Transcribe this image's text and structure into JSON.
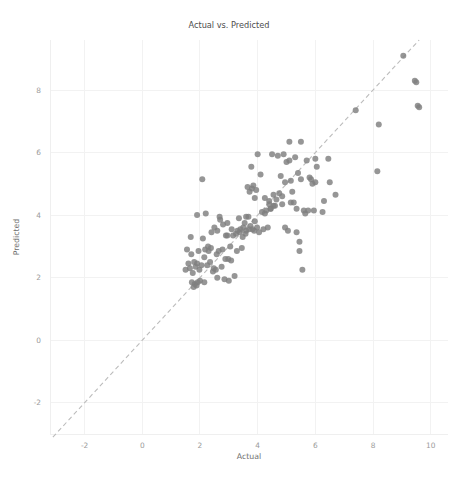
{
  "figure": {
    "width": 458,
    "height": 478,
    "background": "#ffffff"
  },
  "chart_data": {
    "type": "scatter",
    "title": "Actual vs. Predicted",
    "xlabel": "Actual",
    "ylabel": "Predicted",
    "xlim": [
      -3.2,
      10.6
    ],
    "ylim": [
      -3.0,
      9.6
    ],
    "xticks": [
      -2,
      0,
      2,
      4,
      6,
      8,
      10
    ],
    "xticklabels": [
      "-2",
      "0",
      "2",
      "4",
      "6",
      "8",
      "10"
    ],
    "yticks": [
      -2,
      0,
      2,
      4,
      6,
      8
    ],
    "yticklabels": [
      "-2",
      "0",
      "2",
      "4",
      "6",
      "8"
    ],
    "grid": true,
    "legend": null,
    "marker_color": "#7f7f7f",
    "marker_size": 6,
    "marker_opacity": 0.82,
    "reference_line": {
      "name": "identity-line",
      "style": "dashed",
      "color": "#bcbcbc",
      "equation": "y = x",
      "from": [
        -3.1,
        -3.1
      ],
      "to": [
        9.6,
        9.6
      ]
    },
    "n_points": 152,
    "x": [
      9.05,
      9.45,
      9.5,
      9.55,
      9.6,
      8.2,
      8.15,
      7.4,
      6.7,
      6.5,
      6.45,
      6.3,
      6.05,
      6.0,
      5.95,
      5.9,
      5.85,
      5.8,
      5.75,
      5.7,
      5.65,
      5.6,
      5.55,
      5.5,
      5.45,
      5.4,
      5.35,
      5.3,
      5.25,
      5.2,
      5.15,
      5.1,
      5.05,
      5.0,
      4.95,
      4.9,
      4.85,
      4.8,
      4.75,
      4.7,
      4.65,
      4.6,
      4.55,
      4.5,
      4.45,
      4.4,
      4.35,
      4.3,
      4.25,
      4.2,
      4.15,
      4.1,
      4.05,
      4.0,
      3.98,
      3.95,
      3.9,
      3.88,
      3.85,
      3.82,
      3.8,
      3.78,
      3.75,
      3.72,
      3.7,
      3.68,
      3.65,
      3.6,
      3.58,
      3.55,
      3.5,
      3.48,
      3.45,
      3.4,
      3.38,
      3.35,
      3.3,
      3.28,
      3.25,
      3.2,
      3.15,
      3.1,
      3.08,
      3.05,
      3.0,
      2.98,
      2.95,
      2.9,
      2.88,
      2.85,
      2.8,
      2.78,
      2.75,
      2.7,
      2.68,
      2.65,
      2.6,
      2.58,
      2.55,
      2.5,
      2.48,
      2.45,
      2.4,
      2.38,
      2.35,
      2.3,
      2.28,
      2.25,
      2.2,
      2.18,
      2.15,
      2.1,
      2.08,
      2.05,
      2.0,
      1.98,
      1.95,
      1.92,
      1.9,
      1.88,
      1.85,
      1.82,
      1.8,
      1.78,
      1.75,
      1.72,
      1.7,
      1.68,
      1.65,
      1.6,
      1.55,
      1.5,
      5.45,
      5.5,
      5.1,
      4.95,
      4.55,
      5.35,
      4.45,
      3.9,
      4.25,
      6.25,
      6.0,
      5.15,
      4.85,
      4.4,
      3.6,
      2.95,
      2.6,
      2.15,
      1.9
    ],
    "y": [
      9.1,
      8.3,
      8.25,
      7.5,
      7.45,
      6.9,
      5.4,
      7.35,
      4.65,
      5.05,
      5.8,
      4.45,
      5.55,
      5.05,
      4.15,
      5.0,
      5.15,
      5.2,
      4.15,
      5.75,
      4.05,
      4.15,
      2.25,
      6.35,
      3.15,
      5.35,
      4.2,
      5.85,
      4.4,
      4.75,
      5.1,
      6.35,
      3.5,
      5.7,
      3.6,
      5.95,
      4.35,
      5.25,
      4.7,
      5.9,
      4.5,
      4.3,
      4.65,
      5.95,
      4.2,
      4.45,
      3.6,
      4.15,
      4.55,
      3.55,
      4.1,
      5.3,
      3.45,
      5.95,
      3.6,
      4.8,
      4.55,
      3.5,
      4.95,
      3.55,
      4.85,
      5.55,
      3.65,
      4.75,
      3.55,
      3.95,
      4.9,
      3.5,
      3.4,
      3.75,
      3.6,
      3.3,
      2.95,
      3.55,
      3.45,
      3.9,
      3.5,
      2.85,
      3.4,
      2.05,
      3.35,
      3.55,
      2.55,
      3.0,
      1.9,
      2.6,
      3.75,
      3.35,
      2.6,
      1.95,
      3.7,
      2.9,
      2.35,
      3.85,
      3.95,
      2.85,
      3.5,
      2.75,
      2.25,
      3.6,
      2.3,
      2.2,
      3.45,
      2.95,
      2.5,
      2.85,
      3.0,
      2.4,
      4.05,
      2.9,
      2.65,
      3.25,
      5.15,
      2.4,
      1.9,
      2.25,
      2.85,
      1.85,
      2.45,
      1.75,
      2.35,
      1.8,
      2.5,
      1.7,
      2.15,
      1.85,
      2.75,
      3.3,
      2.3,
      2.45,
      2.9,
      2.25,
      2.85,
      5.15,
      5.75,
      5.05,
      4.3,
      3.45,
      4.2,
      3.8,
      4.05,
      4.1,
      5.8,
      4.4,
      4.6,
      4.35,
      3.95,
      3.35,
      2.0,
      1.85,
      4.0,
      1.75
    ]
  },
  "axes_pixels": {
    "left": 50,
    "right": 448,
    "top": 40,
    "bottom": 434
  }
}
